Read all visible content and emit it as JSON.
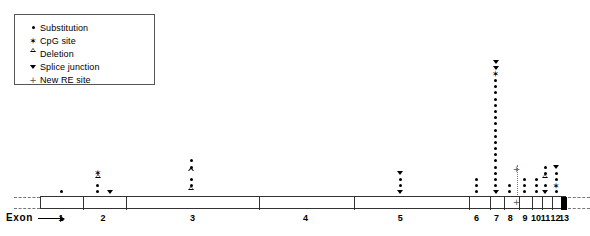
{
  "figure": {
    "type": "gene-mutation-map",
    "caption_label": "Exon"
  },
  "legend": {
    "items": [
      {
        "symbol": "dot",
        "icon": "substitution-dot-icon",
        "label": "Substitution"
      },
      {
        "symbol": "star",
        "icon": "cpg-star-icon",
        "label": "CpG site"
      },
      {
        "symbol": "open-triangle",
        "icon": "deletion-triangle-icon",
        "label": "Deletion"
      },
      {
        "symbol": "down-triangle",
        "icon": "splice-junction-icon",
        "label": "Splice junction"
      },
      {
        "symbol": "plus",
        "icon": "new-re-site-icon",
        "label": "New RE site"
      }
    ]
  },
  "gene": {
    "exons": [
      {
        "number": "1",
        "center_pct": 4.0,
        "filled": false
      },
      {
        "number": "2",
        "center_pct": 12.0,
        "filled": false
      },
      {
        "number": "3",
        "center_pct": 29.0,
        "filled": false
      },
      {
        "number": "4",
        "center_pct": 50.5,
        "filled": false
      },
      {
        "number": "5",
        "center_pct": 68.5,
        "filled": false
      },
      {
        "number": "6",
        "center_pct": 83.0,
        "filled": false
      },
      {
        "number": "7",
        "center_pct": 86.8,
        "filled": false
      },
      {
        "number": "8",
        "center_pct": 89.4,
        "filled": false
      },
      {
        "number": "9",
        "center_pct": 92.2,
        "filled": false
      },
      {
        "number": "10",
        "center_pct": 94.3,
        "filled": false
      },
      {
        "number": "11",
        "center_pct": 96.1,
        "filled": false
      },
      {
        "number": "12",
        "center_pct": 98.0,
        "filled": false
      },
      {
        "number": "13",
        "center_pct": 99.6,
        "filled": true
      }
    ],
    "dividers_pct": [
      8.0,
      16.2,
      41.5,
      59.5,
      81.4,
      85.4,
      88.0,
      90.9,
      93.3,
      95.2,
      97.1,
      98.8
    ],
    "filled_region": {
      "start_pct": 98.8,
      "end_pct": 100.0
    }
  },
  "chart_data": {
    "type": "scatter",
    "title": "",
    "xlabel": "Exon",
    "ylabel": "",
    "marker_types": [
      "dot",
      "star",
      "open-triangle",
      "down-triangle",
      "plus"
    ],
    "columns": [
      {
        "name": "col-exon1",
        "x_pct": 4.0,
        "markers": [
          "dot"
        ]
      },
      {
        "name": "col-exon2-a",
        "x_pct": 11.0,
        "markers": [
          "dot",
          "dot",
          "open-triangle",
          "star"
        ]
      },
      {
        "name": "col-exon2-b",
        "x_pct": 13.4,
        "markers": [
          "down-triangle"
        ]
      },
      {
        "name": "col-exon3",
        "x_pct": 28.8,
        "markers": [
          "open-triangle",
          "dot",
          "dot",
          "open-triangle",
          "dot",
          "dot"
        ]
      },
      {
        "name": "col-exon5",
        "x_pct": 68.5,
        "markers": [
          "down-triangle",
          "dot",
          "dot",
          "down-triangle"
        ]
      },
      {
        "name": "col-exon6",
        "x_pct": 83.0,
        "markers": [
          "dot",
          "dot",
          "dot"
        ]
      },
      {
        "name": "col-exon7",
        "x_pct": 86.6,
        "markers": [
          "down-triangle",
          "dot",
          "dot",
          "dot",
          "dot",
          "dot",
          "dot",
          "dot",
          "dot",
          "dot",
          "dot",
          "dot",
          "dot",
          "dot",
          "dot",
          "dot",
          "dot",
          "dot",
          "dot",
          "star",
          "down-triangle",
          "down-triangle"
        ]
      },
      {
        "name": "col-exon8",
        "x_pct": 89.2,
        "markers": [
          "dot",
          "dot"
        ]
      },
      {
        "name": "col-exon9",
        "x_pct": 92.2,
        "markers": [
          "dot",
          "dot",
          "dot"
        ]
      },
      {
        "name": "col-exon10",
        "x_pct": 94.3,
        "markers": [
          "dot",
          "dot",
          "dot"
        ]
      },
      {
        "name": "col-exon11",
        "x_pct": 96.1,
        "markers": [
          "down-triangle",
          "dot",
          "open-triangle",
          "dot",
          "dot"
        ]
      },
      {
        "name": "col-exon12",
        "x_pct": 98.1,
        "markers": [
          "dot",
          "star",
          "dot",
          "dot",
          "down-triangle"
        ]
      }
    ],
    "re_site": {
      "name": "new-re-site-connector",
      "x_pct": 90.6,
      "top_marker": "plus",
      "bottom_marker": "plus"
    }
  }
}
